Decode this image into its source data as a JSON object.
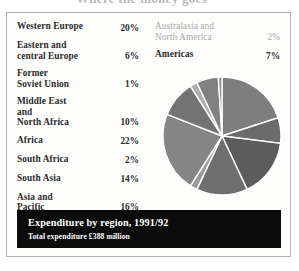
{
  "cropped_headline": "Where the money goes",
  "legend": {
    "left_column": [
      {
        "label": "Western Europe",
        "value": "20%"
      },
      {
        "label": "Eastern and\ncentral Europe",
        "value": "6%"
      },
      {
        "label": "Former\nSoviet Union",
        "value": "1%"
      },
      {
        "label": "Middle East\nand\nNorth Africa",
        "value": "10%"
      },
      {
        "label": "Africa",
        "value": "22%"
      },
      {
        "label": "South Africa",
        "value": "2%"
      },
      {
        "label": "South Asia",
        "value": "14%"
      },
      {
        "label": "Asia and\nPacific",
        "value": "16%"
      }
    ],
    "right_column": [
      {
        "label": "Australasia and\nNorth America",
        "value": "2%",
        "faded": true
      },
      {
        "label": "Americas",
        "value": "7%",
        "faded": false
      }
    ]
  },
  "caption": {
    "title": "Expenditure by region, 1991/92",
    "subtitle": "Total expenditure £388 million"
  },
  "colors": {
    "frame_border": "#b0b0b0",
    "figure_background": "#fdfdfc",
    "caption_background": "#0b0b0b",
    "caption_text": "#ffffff",
    "legend_text": "#2b2b2b",
    "legend_text_faded": "#a9a9a9",
    "slice_separator": "#ffffff"
  },
  "chart_data": {
    "type": "pie",
    "title": "Expenditure by region, 1991/92",
    "subtitle": "Total expenditure £388 million",
    "unit": "percent",
    "total": "£388 million",
    "legend_position": "left and upper-right",
    "grid": false,
    "start_angle_deg": -90,
    "direction": "clockwise",
    "categories": [
      "Western Europe",
      "Americas",
      "Asia and Pacific",
      "South Asia",
      "South Africa",
      "Africa",
      "Middle East and North Africa",
      "Australasia and North America",
      "Eastern and central Europe",
      "Former Soviet Union"
    ],
    "values": [
      20,
      7,
      16,
      14,
      2,
      22,
      10,
      2,
      6,
      1
    ],
    "slices": [
      {
        "label": "Western Europe",
        "value": 20,
        "color": "#7e7e7e"
      },
      {
        "label": "Americas",
        "value": 7,
        "color": "#6b6b6b"
      },
      {
        "label": "Asia and Pacific",
        "value": 16,
        "color": "#5c5c5c"
      },
      {
        "label": "South Asia",
        "value": 14,
        "color": "#6f6f6f"
      },
      {
        "label": "South Africa",
        "value": 2,
        "color": "#9a9a9a"
      },
      {
        "label": "Africa",
        "value": 22,
        "color": "#858585"
      },
      {
        "label": "Middle East and North Africa",
        "value": 10,
        "color": "#737373"
      },
      {
        "label": "Australasia and North America",
        "value": 2,
        "color": "#adadad"
      },
      {
        "label": "Eastern and central Europe",
        "value": 6,
        "color": "#818181"
      },
      {
        "label": "Former Soviet Union",
        "value": 1,
        "color": "#8d8d8d"
      }
    ]
  }
}
